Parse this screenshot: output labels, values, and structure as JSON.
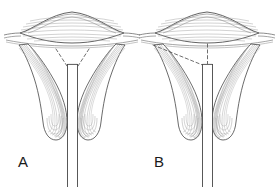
{
  "figure": {
    "title": "",
    "type": "anatomical-line-drawing",
    "background_color": "#ffffff",
    "ink_color": "#3a3a3a",
    "striation_color": "#8c8c8c",
    "dashed_color": "#4a4a4a",
    "panels": [
      {
        "id": "A",
        "label": "A",
        "label_x": 18,
        "label_y": 154,
        "description": "Symmetric configuration: two dashed lines form a V converging onto the top of the central canal",
        "dashed_guides": "symmetric-v",
        "center_x": 72
      },
      {
        "id": "B",
        "label": "B",
        "label_x": 154,
        "label_y": 154,
        "description": "Asymmetric configuration: one dashed diagonal from the upper left plus one vertical dashed line above the central canal",
        "dashed_guides": "asymmetric-diagonal-and-vertical",
        "center_x": 207
      }
    ],
    "parts": [
      {
        "name": "fundus-body",
        "shape": "lens",
        "striations": "horizontal"
      },
      {
        "name": "left-horn",
        "shape": "curved-club",
        "striations": "longitudinal"
      },
      {
        "name": "right-horn",
        "shape": "curved-club",
        "striations": "longitudinal"
      },
      {
        "name": "central-canal",
        "shape": "narrow-vertical-tube"
      }
    ]
  }
}
